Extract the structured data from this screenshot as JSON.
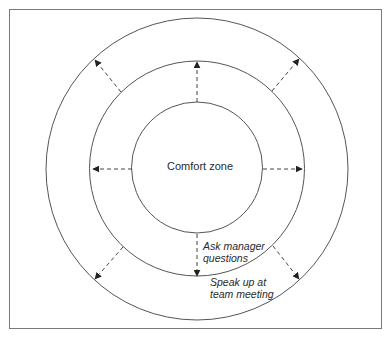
{
  "diagram": {
    "type": "concentric-zones",
    "zones": [
      {
        "id": "comfort",
        "label": "Comfort zone",
        "cx": 197,
        "cy": 168,
        "r": 65
      },
      {
        "id": "stretch-1",
        "label": "Ask manager questions",
        "cx": 197,
        "cy": 168,
        "r": 108
      },
      {
        "id": "stretch-2",
        "label": "Speak up at team meeting",
        "cx": 197,
        "cy": 168,
        "r": 152
      }
    ],
    "labels": {
      "center": "Comfort zone",
      "middle_line1": "Ask manager",
      "middle_line2": "questions",
      "outer_line1": "Speak up at",
      "outer_line2": "team meeting"
    },
    "arrows": [
      {
        "id": "up",
        "from": [
          197,
          102
        ],
        "to": [
          197,
          61
        ]
      },
      {
        "id": "left",
        "from": [
          132,
          169
        ],
        "to": [
          92,
          169
        ]
      },
      {
        "id": "right",
        "from": [
          262,
          169
        ],
        "to": [
          302,
          169
        ]
      },
      {
        "id": "down",
        "from": [
          197,
          233
        ],
        "to": [
          197,
          276
        ]
      },
      {
        "id": "upper-left",
        "from": [
          121,
          92
        ],
        "to": [
          95,
          60
        ]
      },
      {
        "id": "upper-right",
        "from": [
          272,
          91
        ],
        "to": [
          299,
          59
        ]
      },
      {
        "id": "lower-left",
        "from": [
          123,
          247
        ],
        "to": [
          95,
          279
        ]
      },
      {
        "id": "lower-right",
        "from": [
          273,
          246
        ],
        "to": [
          299,
          279
        ]
      }
    ],
    "colors": {
      "stroke": "#555555",
      "text": "#2a2a2a",
      "border": "#7a7a7a",
      "background": "#ffffff"
    }
  }
}
